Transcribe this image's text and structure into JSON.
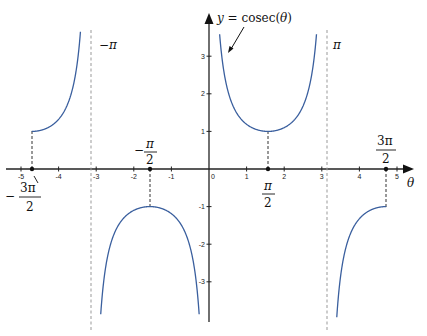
{
  "chart_data": {
    "type": "line",
    "title": "y = cosec(θ)",
    "function": "cosec(theta)",
    "xlabel": "θ",
    "ylabel": "y",
    "xlim": [
      -5.5,
      5.3
    ],
    "ylim": [
      -4,
      3.7
    ],
    "grid": false,
    "x_ticks": [
      -5,
      -4,
      -3,
      -2,
      -1,
      0,
      1,
      2,
      3,
      4,
      5
    ],
    "y_ticks": [
      -3,
      -2,
      -1,
      1,
      2,
      3
    ],
    "x_tick_labels": [
      "-5",
      "-4",
      "-3",
      "-2",
      "-1",
      "0",
      "1",
      "2",
      "3",
      "4",
      "5"
    ],
    "y_tick_labels": [
      "-3",
      "-2",
      "-1",
      "1",
      "2",
      "3"
    ],
    "domain": [
      -4.712,
      4.712
    ],
    "asymptotes": [
      {
        "x": -3.1416,
        "label": "−π"
      },
      {
        "x": 3.1416,
        "label": "π"
      }
    ],
    "key_points": [
      {
        "x": -4.712,
        "y": 1,
        "label": "−3π/2"
      },
      {
        "x": -1.5708,
        "y": -1,
        "label": "−π/2"
      },
      {
        "x": 1.5708,
        "y": 1,
        "label": "π/2"
      },
      {
        "x": 4.712,
        "y": -1,
        "label": "3π/2"
      }
    ],
    "series": [
      {
        "name": "branch-1",
        "x_range": [
          -4.712,
          -3.25
        ],
        "values_desc": "from (−3π/2, 1) rising to +∞ at −π"
      },
      {
        "name": "branch-2",
        "x_range": [
          -3.05,
          -0.09
        ],
        "values_desc": "from −∞ near −π up to max (−π/2, −1) then down to −∞ at 0"
      },
      {
        "name": "branch-3",
        "x_range": [
          0.26,
          2.88
        ],
        "values_desc": "from +∞ near 0 down to min (π/2, 1) then up to +∞ at π"
      },
      {
        "name": "branch-4",
        "x_range": [
          3.23,
          4.712
        ],
        "values_desc": "from −∞ near π rising to (3π/2, −1)"
      }
    ],
    "curve_color": "#3a5f9e",
    "annotations": [
      {
        "text": "y = cosec(θ)",
        "arrow_to": [
          0.45,
          3.2
        ]
      }
    ]
  },
  "labels": {
    "func_y": "y",
    "func_rest": " = cosec(",
    "func_theta": "θ",
    "func_close": ")",
    "axis_theta": "θ",
    "neg_pi": "−π",
    "pi": "π",
    "neg_half_pi_minus": "−",
    "neg_half_pi_num": "π",
    "half_den": "2",
    "half_pi_num": "π",
    "three_half_pi_num": "3π",
    "neg_three_half_pi_minus": "−",
    "neg_three_half_pi_num": "3π"
  }
}
